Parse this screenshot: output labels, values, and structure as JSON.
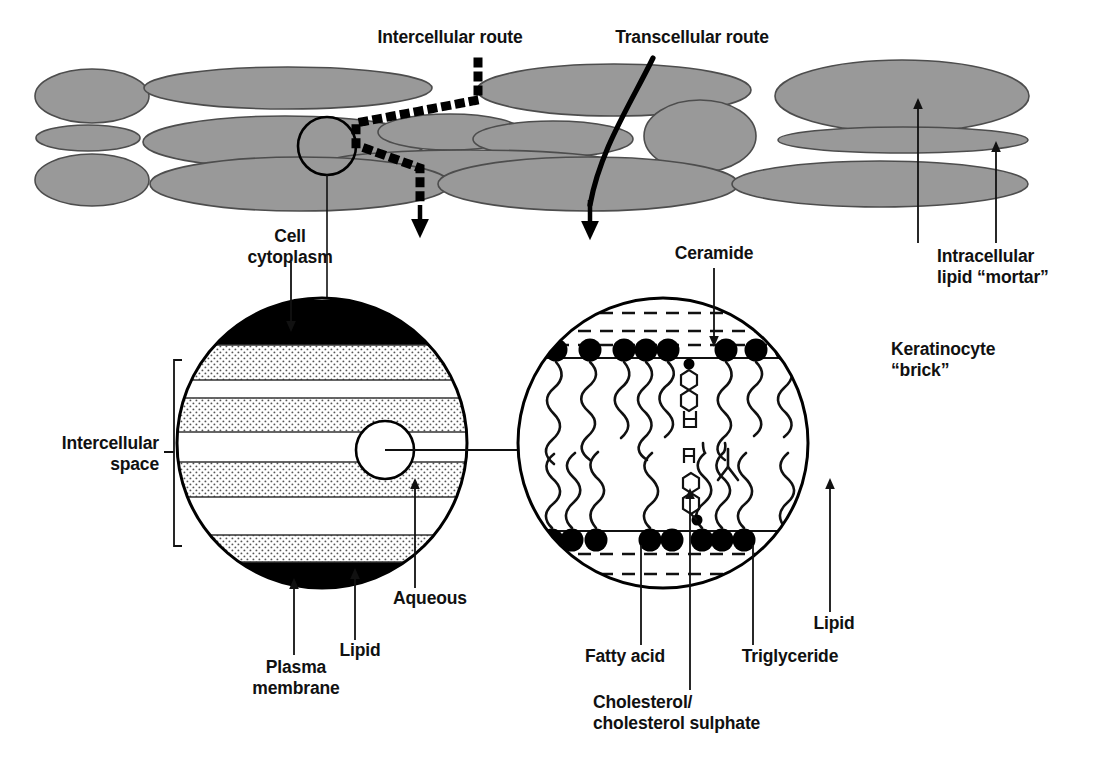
{
  "figure": {
    "colors": {
      "cell_fill": "#999999",
      "cell_stroke": "#4d4d4d",
      "line": "#000000",
      "stipple_fill": "#d8d8d8",
      "background": "#ffffff",
      "text": "#111111"
    }
  },
  "labels": {
    "intercellular_route": "Intercellular route",
    "transcellular_route": "Transcellular route",
    "cell_cytoplasm_line1": "Cell",
    "cell_cytoplasm_line2": "cytoplasm",
    "intracellular_lipid_line1": "Intracellular",
    "intracellular_lipid_line2": "lipid “mortar”",
    "keratinocyte_line1": "Keratinocyte",
    "keratinocyte_line2": "“brick”",
    "intercellular_space_line1": "Intercellular",
    "intercellular_space_line2": "space",
    "ceramide": "Ceramide",
    "aqueous": "Aqueous",
    "lipid_left": "Lipid",
    "plasma_membrane_line1": "Plasma",
    "plasma_membrane_line2": "membrane",
    "fatty_acid": "Fatty acid",
    "cholesterol_line1": "Cholesterol/",
    "cholesterol_line2": "cholesterol sulphate",
    "triglyceride": "Triglyceride",
    "lipid_right": "Lipid"
  },
  "diagram": {
    "top_layer": {
      "description": "Brick-and-mortar arrangement of flattened keratinocyte cells",
      "cells": [
        {
          "cx": 92,
          "cy": 96,
          "rx": 57,
          "ry": 27
        },
        {
          "cx": 288,
          "cy": 88,
          "rx": 144,
          "ry": 21
        },
        {
          "cx": 614,
          "cy": 90,
          "rx": 137,
          "ry": 26
        },
        {
          "cx": 902,
          "cy": 96,
          "rx": 127,
          "ry": 36
        },
        {
          "cx": 88,
          "cy": 138,
          "rx": 52,
          "ry": 13
        },
        {
          "cx": 285,
          "cy": 142,
          "rx": 142,
          "ry": 26
        },
        {
          "cx": 450,
          "cy": 132,
          "rx": 72,
          "ry": 18
        },
        {
          "cx": 550,
          "cy": 140,
          "rx": 80,
          "ry": 18
        },
        {
          "cx": 470,
          "cy": 162,
          "rx": 145,
          "ry": 13
        },
        {
          "cx": 700,
          "cy": 136,
          "rx": 56,
          "ry": 36
        },
        {
          "cx": 903,
          "cy": 140,
          "rx": 125,
          "ry": 13
        },
        {
          "cx": 92,
          "cy": 180,
          "rx": 57,
          "ry": 26
        },
        {
          "cx": 300,
          "cy": 184,
          "rx": 150,
          "ry": 27
        },
        {
          "cx": 588,
          "cy": 184,
          "rx": 150,
          "ry": 27
        },
        {
          "cx": 880,
          "cy": 184,
          "rx": 148,
          "ry": 23
        }
      ]
    },
    "routes": {
      "intercellular": {
        "style": "dotted-thick",
        "ends_with": "arrow-down"
      },
      "transcellular": {
        "style": "solid-thick-curved",
        "ends_with": "arrow-down"
      }
    },
    "left_circle": {
      "cx": 322,
      "cy": 443,
      "r": 145,
      "description": "Magnified view of intercellular space showing alternating lipid and aqueous lamellae between two plasma membranes",
      "bands": [
        {
          "type": "plasma-membrane",
          "y0": 305,
          "y1": 345,
          "fill": "black"
        },
        {
          "type": "lipid",
          "y0": 345,
          "y1": 380,
          "fill": "stipple"
        },
        {
          "type": "aqueous",
          "y0": 380,
          "y1": 398,
          "fill": "white"
        },
        {
          "type": "lipid",
          "y0": 398,
          "y1": 432,
          "fill": "stipple"
        },
        {
          "type": "aqueous",
          "y0": 432,
          "y1": 462,
          "fill": "white"
        },
        {
          "type": "lipid",
          "y0": 462,
          "y1": 497,
          "fill": "stipple"
        },
        {
          "type": "aqueous",
          "y0": 497,
          "y1": 535,
          "fill": "white"
        },
        {
          "type": "lipid",
          "y0": 535,
          "y1": 562,
          "fill": "stipple"
        },
        {
          "type": "plasma-membrane",
          "y0": 562,
          "y1": 588,
          "fill": "black"
        }
      ],
      "inset_circle": {
        "cx": 385,
        "cy": 450,
        "r": 29
      }
    },
    "right_circle": {
      "cx": 663,
      "cy": 443,
      "r": 145,
      "description": "Molecular detail of an intercellular lipid bilayer with polar head groups, hydrocarbon tails, cholesterol and triglyceride molecules",
      "bilayer": {
        "upper_headgroup_y": 350,
        "lower_headgroup_y": 538,
        "headgroup_radius": 11,
        "dashed_lines_y": [
          313,
          330,
          345,
          552,
          572,
          592
        ]
      }
    }
  }
}
